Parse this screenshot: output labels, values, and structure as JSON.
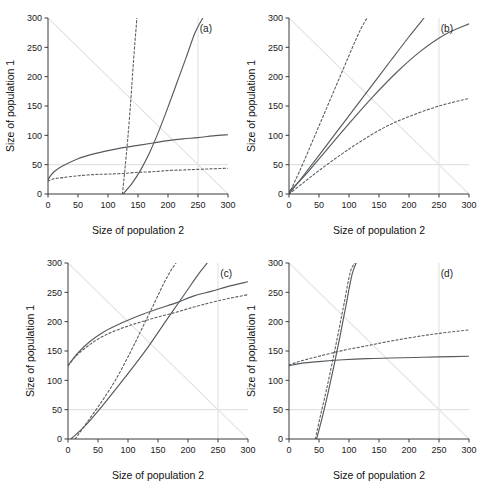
{
  "figure": {
    "panels": [
      "a",
      "b",
      "c",
      "d"
    ],
    "axis": {
      "xlabel": "Size of population 2",
      "ylabel": "Size of population 1",
      "xticks": [
        0,
        50,
        100,
        150,
        200,
        250,
        300
      ],
      "yticks": [
        0,
        50,
        100,
        150,
        200,
        250,
        300
      ],
      "xlim": [
        0,
        300
      ],
      "ylim": [
        0,
        300
      ]
    },
    "labels": {
      "a": "(a)",
      "b": "(b)",
      "c": "(c)",
      "d": "(d)"
    },
    "colors": {
      "curve": "#555a5e",
      "guide": "#e2e2e2",
      "axis": "#3a3a3a",
      "background": "#ffffff"
    }
  },
  "chart_data": [
    {
      "type": "line",
      "panel": "(a)",
      "title": "",
      "xlabel": "Size of population 2",
      "ylabel": "Size of population 1",
      "xlim": [
        0,
        300
      ],
      "ylim": [
        0,
        300
      ],
      "grid": false,
      "legend": "none",
      "guides": [
        {
          "name": "anti-diagonal",
          "style": "solid-faint",
          "x": [
            0,
            300
          ],
          "y": [
            300,
            0
          ]
        },
        {
          "name": "horizontal-50",
          "style": "solid-faint",
          "x": [
            0,
            300
          ],
          "y": [
            50,
            50
          ]
        },
        {
          "name": "vertical-250",
          "style": "solid-faint",
          "x": [
            250,
            250
          ],
          "y": [
            0,
            300
          ]
        }
      ],
      "series": [
        {
          "name": "isocline-1-solid-saturating",
          "style": "solid",
          "x": [
            0,
            10,
            25,
            50,
            75,
            100,
            125,
            150,
            175,
            200,
            225,
            250,
            275,
            300
          ],
          "y": [
            25,
            38,
            48,
            60,
            68,
            74,
            79,
            83,
            87,
            91,
            94,
            96,
            99,
            101
          ]
        },
        {
          "name": "isocline-2-dashed-saturating",
          "style": "dashed",
          "x": [
            0,
            10,
            25,
            50,
            75,
            100,
            125,
            150,
            175,
            200,
            225,
            250,
            275,
            300
          ],
          "y": [
            22,
            26,
            28,
            31,
            33,
            34,
            35,
            37,
            38,
            40,
            41,
            42,
            43,
            44
          ]
        },
        {
          "name": "isocline-3-solid-steep-rising",
          "style": "solid",
          "x": [
            125,
            140,
            155,
            170,
            185,
            200,
            215,
            230,
            245,
            258
          ],
          "y": [
            0,
            18,
            42,
            72,
            108,
            148,
            190,
            232,
            275,
            300
          ]
        },
        {
          "name": "isocline-4-dashed-near-vertical",
          "style": "dashed",
          "x": [
            124,
            128,
            133,
            138,
            142,
            145,
            147,
            148
          ],
          "y": [
            0,
            40,
            95,
            160,
            220,
            260,
            285,
            300
          ]
        }
      ]
    },
    {
      "type": "line",
      "panel": "(b)",
      "title": "",
      "xlabel": "Size of population 2",
      "ylabel": "Size of population 1",
      "xlim": [
        0,
        300
      ],
      "ylim": [
        0,
        300
      ],
      "grid": false,
      "legend": "none",
      "guides": [
        {
          "name": "anti-diagonal",
          "style": "solid-faint",
          "x": [
            0,
            300
          ],
          "y": [
            300,
            0
          ]
        },
        {
          "name": "horizontal-50",
          "style": "solid-faint",
          "x": [
            0,
            300
          ],
          "y": [
            50,
            50
          ]
        },
        {
          "name": "vertical-250",
          "style": "solid-faint",
          "x": [
            250,
            250
          ],
          "y": [
            0,
            300
          ]
        }
      ],
      "series": [
        {
          "name": "isocline-1-dashed-steep",
          "style": "dashed",
          "x": [
            0,
            10,
            25,
            45,
            65,
            85,
            105,
            120,
            130
          ],
          "y": [
            0,
            22,
            56,
            104,
            152,
            200,
            248,
            282,
            300
          ]
        },
        {
          "name": "isocline-2-solid-steep",
          "style": "solid",
          "x": [
            0,
            20,
            50,
            90,
            130,
            170,
            200,
            225
          ],
          "y": [
            0,
            26,
            66,
            120,
            174,
            228,
            268,
            300
          ]
        },
        {
          "name": "isocline-3-solid-moderate",
          "style": "solid",
          "x": [
            0,
            25,
            60,
            100,
            140,
            180,
            220,
            260,
            300
          ],
          "y": [
            4,
            30,
            72,
            120,
            166,
            208,
            244,
            272,
            290
          ]
        },
        {
          "name": "isocline-4-dashed-shallow",
          "style": "dashed",
          "x": [
            0,
            25,
            50,
            85,
            120,
            160,
            200,
            250,
            300
          ],
          "y": [
            0,
            20,
            40,
            66,
            90,
            114,
            132,
            150,
            163
          ]
        }
      ]
    },
    {
      "type": "line",
      "panel": "(c)",
      "title": "",
      "xlabel": "Size of population 2",
      "ylabel": "Size of population 1",
      "xlim": [
        0,
        300
      ],
      "ylim": [
        0,
        300
      ],
      "grid": false,
      "legend": "none",
      "guides": [
        {
          "name": "anti-diagonal",
          "style": "solid-faint",
          "x": [
            0,
            300
          ],
          "y": [
            300,
            0
          ]
        },
        {
          "name": "horizontal-50",
          "style": "solid-faint",
          "x": [
            0,
            300
          ],
          "y": [
            50,
            50
          ]
        },
        {
          "name": "vertical-250",
          "style": "solid-faint",
          "x": [
            250,
            250
          ],
          "y": [
            0,
            300
          ]
        }
      ],
      "series": [
        {
          "name": "isocline-1-solid-saturating",
          "style": "solid",
          "x": [
            0,
            15,
            35,
            60,
            90,
            120,
            150,
            180,
            210,
            240,
            270,
            300
          ],
          "y": [
            125,
            145,
            165,
            183,
            198,
            211,
            222,
            232,
            244,
            252,
            261,
            268
          ]
        },
        {
          "name": "isocline-2-dashed-saturating",
          "style": "dashed",
          "x": [
            0,
            15,
            35,
            60,
            90,
            120,
            150,
            180,
            210,
            240,
            270,
            300
          ],
          "y": [
            125,
            143,
            160,
            176,
            189,
            199,
            208,
            216,
            225,
            233,
            240,
            246
          ]
        },
        {
          "name": "isocline-3-dashed-steep",
          "style": "dashed",
          "x": [
            12,
            30,
            55,
            80,
            105,
            125,
            145,
            160,
            172,
            180
          ],
          "y": [
            0,
            26,
            62,
            102,
            150,
            192,
            234,
            266,
            288,
            300
          ]
        },
        {
          "name": "isocline-4-solid-steep",
          "style": "solid",
          "x": [
            5,
            30,
            60,
            95,
            130,
            165,
            195,
            218,
            232
          ],
          "y": [
            0,
            24,
            60,
            105,
            152,
            204,
            248,
            282,
            300
          ]
        }
      ]
    },
    {
      "type": "line",
      "panel": "(d)",
      "title": "",
      "xlabel": "Size of population 2",
      "ylabel": "Size of population 1",
      "xlim": [
        0,
        300
      ],
      "ylim": [
        0,
        300
      ],
      "grid": false,
      "legend": "none",
      "guides": [
        {
          "name": "anti-diagonal",
          "style": "solid-faint",
          "x": [
            0,
            300
          ],
          "y": [
            300,
            0
          ]
        },
        {
          "name": "horizontal-50",
          "style": "solid-faint",
          "x": [
            0,
            300
          ],
          "y": [
            50,
            50
          ]
        },
        {
          "name": "vertical-250",
          "style": "solid-faint",
          "x": [
            250,
            250
          ],
          "y": [
            0,
            300
          ]
        }
      ],
      "series": [
        {
          "name": "isocline-1-solid-flat",
          "style": "solid",
          "x": [
            0,
            20,
            50,
            90,
            130,
            170,
            210,
            250,
            300
          ],
          "y": [
            125,
            129,
            132,
            135,
            137,
            138,
            139,
            140,
            141
          ]
        },
        {
          "name": "isocline-2-dashed-rising",
          "style": "dashed",
          "x": [
            0,
            20,
            50,
            90,
            130,
            170,
            210,
            250,
            300
          ],
          "y": [
            126,
            133,
            141,
            151,
            159,
            167,
            174,
            180,
            186
          ]
        },
        {
          "name": "isocline-3-solid-near-vertical",
          "style": "solid",
          "x": [
            46,
            55,
            65,
            75,
            85,
            95,
            105,
            112
          ],
          "y": [
            0,
            35,
            78,
            125,
            175,
            228,
            280,
            300
          ]
        },
        {
          "name": "isocline-4-dashed-near-vertical",
          "style": "dashed",
          "x": [
            44,
            52,
            62,
            72,
            82,
            92,
            102,
            110
          ],
          "y": [
            0,
            38,
            82,
            130,
            180,
            232,
            284,
            300
          ]
        }
      ]
    }
  ]
}
